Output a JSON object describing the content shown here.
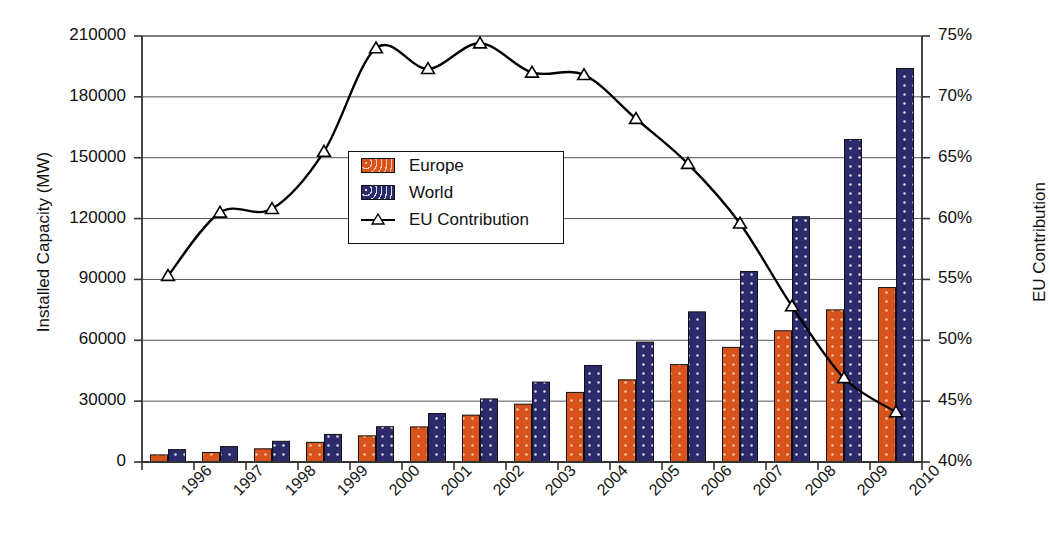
{
  "chart_data": {
    "type": "bar",
    "title": "",
    "subtitle": "",
    "xlabel": "",
    "ylabel": "Installed Capacity (MW)",
    "y2label": "EU Contribution",
    "categories": [
      "1996",
      "1997",
      "1998",
      "1999",
      "2000",
      "2001",
      "2002",
      "2003",
      "2004",
      "2005",
      "2006",
      "2007",
      "2008",
      "2009",
      "2010"
    ],
    "ylim": [
      0,
      210000
    ],
    "y2lim": [
      40,
      75
    ],
    "yticks": [
      0,
      30000,
      60000,
      90000,
      120000,
      150000,
      180000,
      210000
    ],
    "ytick_labels": [
      "0",
      "30000",
      "60000",
      "90000",
      "120000",
      "150000",
      "180000",
      "210000"
    ],
    "y2ticks": [
      40,
      45,
      50,
      55,
      60,
      65,
      70,
      75
    ],
    "y2tick_labels": [
      "40%",
      "45%",
      "50%",
      "55%",
      "60%",
      "65%",
      "70%",
      "75%"
    ],
    "grid": true,
    "legend_position": "upper-center-left",
    "series": [
      {
        "name": "Europe",
        "type": "bar",
        "axis": "left",
        "color": "#D8541C",
        "pattern": "dotted-fill",
        "values": [
          3500,
          4700,
          6500,
          9700,
          12900,
          17300,
          23100,
          28500,
          34300,
          40500,
          48000,
          56500,
          64700,
          75000,
          86000
        ]
      },
      {
        "name": "World",
        "type": "bar",
        "axis": "left",
        "color": "#2B2B6B",
        "pattern": "dotted-fill",
        "values": [
          6100,
          7600,
          10200,
          13600,
          17400,
          23900,
          31100,
          39400,
          47600,
          59100,
          74000,
          93900,
          120900,
          159000,
          194000
        ]
      },
      {
        "name": "EU Contribution",
        "type": "line",
        "axis": "right",
        "color": "#000000",
        "marker": "triangle-up",
        "values": [
          55.3,
          60.5,
          60.8,
          65.5,
          74.0,
          72.3,
          74.4,
          72.0,
          71.8,
          68.2,
          64.5,
          59.6,
          52.8,
          46.9,
          44.1
        ]
      }
    ],
    "legend_entries": [
      "Europe",
      "World",
      "EU Contribution"
    ]
  },
  "legend": {
    "europe_label": "Europe",
    "world_label": "World",
    "eu_label": "EU Contribution"
  },
  "axes": {
    "left_title": "Installed Capacity (MW)",
    "right_title": "EU Contribution"
  }
}
